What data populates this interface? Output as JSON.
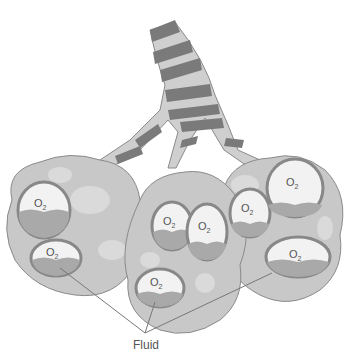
{
  "diagram": {
    "labels": {
      "fluid": "Fluid"
    },
    "alveolus_label": "O",
    "alveolus_subscript": "2",
    "colors": {
      "lobe_fill": "#c8c8c8",
      "lobe_stroke": "#8a8a8a",
      "spot": "#dadada",
      "bronchus": "#cfcfcf",
      "band": "#7a7a7a",
      "sac_fill": "#f2f2f2",
      "fluid": "#a9a9a9",
      "line": "#777777"
    }
  }
}
